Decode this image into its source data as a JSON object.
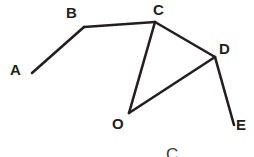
{
  "figure": {
    "background_color": "#ffffff",
    "stroke_color": "#231f20",
    "stroke_width": 2.6,
    "caption_fragment": "C",
    "vertices": [
      {
        "id": "A",
        "label": "A",
        "x": 32,
        "y": 73
      },
      {
        "id": "B",
        "label": "B",
        "x": 84,
        "y": 27
      },
      {
        "id": "C",
        "label": "C",
        "x": 155,
        "y": 22
      },
      {
        "id": "D",
        "label": "D",
        "x": 215,
        "y": 57
      },
      {
        "id": "E",
        "label": "E",
        "x": 234,
        "y": 125
      },
      {
        "id": "O",
        "label": "O",
        "x": 129,
        "y": 113
      }
    ],
    "labels": [
      {
        "id": "A",
        "text": "A",
        "left": 10,
        "top": 62
      },
      {
        "id": "B",
        "text": "B",
        "left": 66,
        "top": 5
      },
      {
        "id": "C",
        "text": "C",
        "left": 153,
        "top": 2
      },
      {
        "id": "D",
        "text": "D",
        "left": 219,
        "top": 41
      },
      {
        "id": "E",
        "text": "E",
        "left": 236,
        "top": 117
      },
      {
        "id": "O",
        "text": "O",
        "left": 112,
        "top": 116
      }
    ],
    "segments": [
      {
        "id": "AB",
        "from": "A",
        "to": "B"
      },
      {
        "id": "BC",
        "from": "B",
        "to": "C"
      },
      {
        "id": "CD",
        "from": "C",
        "to": "D"
      },
      {
        "id": "CO",
        "from": "C",
        "to": "O"
      },
      {
        "id": "OD",
        "from": "O",
        "to": "D"
      },
      {
        "id": "DE",
        "from": "D",
        "to": "E"
      }
    ]
  }
}
